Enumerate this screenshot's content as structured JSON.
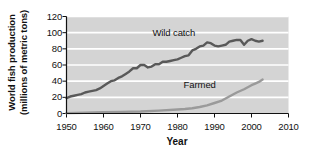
{
  "chart_data": {
    "type": "line",
    "title": "",
    "xlabel": "Year",
    "ylabel_line1": "World fish production",
    "ylabel_line2": "(millions of metric tons)",
    "xlim": [
      1950,
      2010
    ],
    "ylim": [
      0,
      120
    ],
    "xticks": [
      1950,
      1960,
      1970,
      1980,
      1990,
      2000,
      2010
    ],
    "xticklabels": [
      "1950",
      "1960",
      "1970",
      "1980",
      "1990",
      "2000",
      "2010"
    ],
    "yticks": [
      0,
      20,
      40,
      60,
      80,
      100,
      120
    ],
    "yticklabels": [
      "0",
      "20",
      "40",
      "60",
      "80",
      "100",
      "120"
    ],
    "grid": "horizontal-white-gridlines",
    "plot_background": "#d4d4d4",
    "legend": "inline-labels",
    "series": [
      {
        "name": "Wild catch",
        "color": "#595959",
        "label_x": 1979,
        "label_y": 100,
        "x": [
          1950,
          1951,
          1952,
          1953,
          1954,
          1955,
          1956,
          1957,
          1958,
          1959,
          1960,
          1961,
          1962,
          1963,
          1964,
          1965,
          1966,
          1967,
          1968,
          1969,
          1970,
          1971,
          1972,
          1973,
          1974,
          1975,
          1976,
          1977,
          1978,
          1979,
          1980,
          1981,
          1982,
          1983,
          1984,
          1985,
          1986,
          1987,
          1988,
          1989,
          1990,
          1991,
          1992,
          1993,
          1994,
          1995,
          1996,
          1997,
          1998,
          1999,
          2000,
          2001,
          2002,
          2003
        ],
        "values": [
          19,
          21,
          22,
          23,
          24,
          26,
          27,
          28,
          29,
          31,
          34,
          37,
          40,
          41,
          44,
          46,
          49,
          52,
          56,
          56,
          60,
          60,
          57,
          58,
          61,
          61,
          64,
          64,
          65,
          66,
          67,
          69,
          71,
          72,
          78,
          80,
          83,
          84,
          88,
          87,
          84,
          83,
          84,
          85,
          89,
          90,
          91,
          91,
          85,
          90,
          92,
          90,
          89,
          90
        ]
      },
      {
        "name": "Farmed",
        "color": "#9a9a9a",
        "label_x": 1986,
        "label_y": 35,
        "x": [
          1950,
          1955,
          1960,
          1965,
          1970,
          1975,
          1980,
          1982,
          1984,
          1986,
          1988,
          1990,
          1992,
          1994,
          1996,
          1998,
          2000,
          2001,
          2002,
          2003
        ],
        "values": [
          0.5,
          1,
          1.5,
          2,
          2.5,
          3.5,
          5,
          5.5,
          6.5,
          8,
          10,
          13,
          16,
          21,
          26,
          30,
          35,
          37,
          39,
          42
        ]
      }
    ]
  }
}
